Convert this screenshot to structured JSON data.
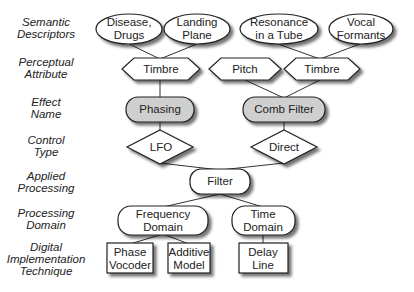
{
  "levels": [
    {
      "label": "Semantic Descriptors",
      "line1": "Semantic",
      "line2": "Descriptors"
    },
    {
      "label": "Perceptual Attribute",
      "line1": "Perceptual",
      "line2": "Attribute"
    },
    {
      "label": "Effect Name",
      "line1": "Effect",
      "line2": "Name"
    },
    {
      "label": "Control Type",
      "line1": "Control",
      "line2": "Type"
    },
    {
      "label": "Applied Processing",
      "line1": "Applied",
      "line2": "Processing"
    },
    {
      "label": "Processing Domain",
      "line1": "Processing",
      "line2": "Domain"
    },
    {
      "label": "Digital Implementation Technique",
      "line1": "Digital",
      "line2": "Implementation",
      "line3": "Technique"
    }
  ],
  "nodes": {
    "disease_drugs": {
      "line1": "Disease,",
      "line2": "Drugs",
      "shape": "ellipse"
    },
    "landing_plane": {
      "line1": "Landing",
      "line2": "Plane",
      "shape": "ellipse"
    },
    "resonance_tube": {
      "line1": "Resonance",
      "line2": "in a Tube",
      "shape": "ellipse"
    },
    "vocal_formants": {
      "line1": "Vocal",
      "line2": "Formants",
      "shape": "ellipse"
    },
    "timbre_left": {
      "label": "Timbre",
      "shape": "hexagon"
    },
    "pitch": {
      "label": "Pitch",
      "shape": "hexagon"
    },
    "timbre_right": {
      "label": "Timbre",
      "shape": "hexagon"
    },
    "phasing": {
      "label": "Phasing",
      "shape": "rounded-rect-shaded"
    },
    "comb_filter": {
      "label": "Comb Filter",
      "shape": "rounded-rect-shaded"
    },
    "lfo": {
      "label": "LFO",
      "shape": "diamond"
    },
    "direct": {
      "label": "Direct",
      "shape": "diamond"
    },
    "filter": {
      "label": "Filter",
      "shape": "rounded-rect"
    },
    "frequency_domain": {
      "line1": "Frequency",
      "line2": "Domain",
      "shape": "rounded-rect"
    },
    "time_domain": {
      "line1": "Time",
      "line2": "Domain",
      "shape": "rounded-rect"
    },
    "phase_vocoder": {
      "line1": "Phase",
      "line2": "Vocoder",
      "shape": "rect"
    },
    "additive_model": {
      "line1": "Additive",
      "line2": "Model",
      "shape": "rect"
    },
    "delay_line": {
      "line1": "Delay",
      "line2": "Line",
      "shape": "rect"
    }
  },
  "edges": [
    [
      "disease_drugs",
      "timbre_left"
    ],
    [
      "landing_plane",
      "timbre_left"
    ],
    [
      "resonance_tube",
      "timbre_right"
    ],
    [
      "vocal_formants",
      "timbre_right"
    ],
    [
      "timbre_left",
      "phasing"
    ],
    [
      "pitch",
      "comb_filter"
    ],
    [
      "timbre_right",
      "comb_filter"
    ],
    [
      "phasing",
      "lfo"
    ],
    [
      "comb_filter",
      "direct"
    ],
    [
      "lfo",
      "filter"
    ],
    [
      "direct",
      "filter"
    ],
    [
      "filter",
      "frequency_domain"
    ],
    [
      "filter",
      "time_domain"
    ],
    [
      "frequency_domain",
      "phase_vocoder"
    ],
    [
      "frequency_domain",
      "additive_model"
    ],
    [
      "time_domain",
      "delay_line"
    ]
  ],
  "colors": {
    "stroke": "#222222",
    "fill": "#ffffff",
    "shaded_fill": "#cfcfcf",
    "shadow": "#9a9a9a"
  }
}
